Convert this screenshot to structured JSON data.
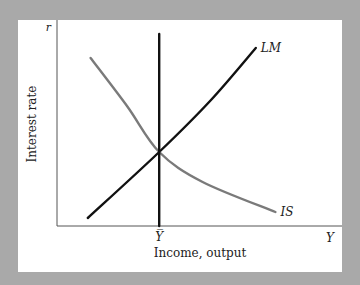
{
  "chart_data": {
    "type": "line",
    "title": "",
    "xlabel": "Income, output",
    "ylabel": "Interest rate",
    "x_axis_symbol": "Y",
    "y_axis_symbol": "r",
    "x_tick_labels": [
      "Y̅"
    ],
    "xlim": [
      0,
      10
    ],
    "ylim": [
      0,
      10
    ],
    "grid": false,
    "legend": "none",
    "series": [
      {
        "name": "LM",
        "label": "LM",
        "color": "#111111",
        "points": [
          [
            1.1,
            0.4
          ],
          [
            3.65,
            3.7
          ],
          [
            5.5,
            6.3
          ],
          [
            7.1,
            8.9
          ]
        ]
      },
      {
        "name": "IS",
        "label": "IS",
        "color": "#7a7a7a",
        "points": [
          [
            1.2,
            8.4
          ],
          [
            2.5,
            6.0
          ],
          [
            3.65,
            3.7
          ],
          [
            5.2,
            2.2
          ],
          [
            7.8,
            0.7
          ]
        ]
      },
      {
        "name": "Full-employment output",
        "label": "",
        "color": "#111111",
        "points": [
          [
            3.65,
            0
          ],
          [
            3.65,
            9.6
          ]
        ]
      }
    ]
  }
}
